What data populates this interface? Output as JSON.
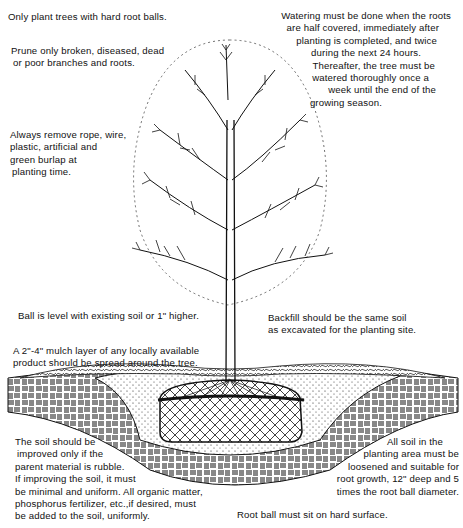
{
  "diagram": {
    "colors": {
      "ink": "#111111",
      "background": "#ffffff"
    },
    "notes": {
      "hard_root_balls": [
        "Only plant trees with hard root balls."
      ],
      "prune": [
        "Prune only broken, diseased, dead",
        "or poor branches and roots."
      ],
      "remove_materials": [
        "Always remove rope, wire,",
        "plastic, artificial and",
        "green burlap at",
        "planting time."
      ],
      "watering": [
        "Watering must be done when the roots",
        "are half covered, immediately after",
        "planting is completed, and twice",
        "during the next 24 hours.",
        "Thereafter, the tree must be",
        "watered thoroughly once a",
        "week until the end of the",
        "growing season."
      ],
      "ball_level": [
        "Ball is level with existing soil or 1\" higher."
      ],
      "backfill": [
        "Backfill should be the same soil",
        "as excavated for the planting site."
      ],
      "mulch": [
        "A 2\"-4\" mulch layer of any locally available",
        "product should be spread around the tree."
      ],
      "soil_improvement": [
        "The soil should be",
        "improved only if the",
        "parent material is rubble.",
        "If improving the soil, it must",
        "be minimal and uniform.  All organic matter,",
        "phosphorus fertilizer, etc.,if desired, must",
        "be added to the soil, uniformly."
      ],
      "planting_area": [
        "All soil in the",
        "planting area must be",
        "loosened and suitable for",
        "root growth, 12\" deep and 5",
        "times the root ball diameter."
      ],
      "root_ball_surface": [
        "Root ball must sit on hard surface."
      ]
    },
    "illustration": {
      "elements": [
        "tree-crown",
        "tree-trunk",
        "mulch-layer",
        "backfill-soil",
        "root-ball",
        "native-soil-hatching"
      ]
    }
  }
}
